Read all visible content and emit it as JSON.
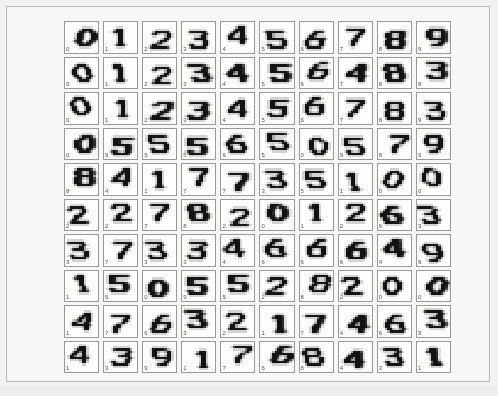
{
  "figure": {
    "type": "digit-thumbnail-grid",
    "rows": 10,
    "columns": 10,
    "total_cells": 100,
    "background_color": "#f2f2f0",
    "panel_color": "#f7f7f5",
    "panel_border_color": "#b8b8b4",
    "cell_background_color": "#fdfdfb",
    "cell_border_color": "#9a9a96",
    "ink_color": "#1a1a1a",
    "label_color": "#5a5a58",
    "label_position": "bottom-left"
  },
  "chart_data": {
    "type": "heatmap",
    "title": "",
    "xlabel": "",
    "ylabel": "",
    "grid": false,
    "legend": "none",
    "rows": 10,
    "columns": 10,
    "labels_by_row": [
      [
        "0",
        "1",
        "2",
        "3",
        "4",
        "5",
        "6",
        "7",
        "8",
        "9"
      ],
      [
        "0",
        "1",
        "2",
        "3",
        "4",
        "5",
        "6",
        "7",
        "8",
        "9"
      ],
      [
        "0",
        "1",
        "2",
        "3",
        "4",
        "5",
        "6",
        "7",
        "8",
        "9"
      ],
      [
        "0",
        "9",
        "5",
        "5",
        "6",
        "5",
        "0",
        "9",
        "8",
        "9"
      ],
      [
        "8",
        "4",
        "1",
        "7",
        "7",
        "3",
        "5",
        "1",
        "0",
        "0"
      ],
      [
        "2",
        "2",
        "7",
        "8",
        "2",
        "0",
        "1",
        "2",
        "6",
        "3"
      ],
      [
        "3",
        "7",
        "3",
        "3",
        "4",
        "6",
        "6",
        "6",
        "4",
        "9"
      ],
      [
        "1",
        "5",
        "0",
        "9",
        "5",
        "2",
        "8",
        "2",
        "0",
        "0"
      ],
      [
        "1",
        "7",
        "6",
        "3",
        "2",
        "1",
        "7",
        "4",
        "6",
        "3"
      ],
      [
        "1",
        "3",
        "9",
        "1",
        "7",
        "6",
        "8",
        "4",
        "3",
        "1"
      ]
    ],
    "glyphs_by_row": [
      [
        "0",
        "1",
        "2",
        "3",
        "4",
        "5",
        "6",
        "7",
        "8",
        "9"
      ],
      [
        "0",
        "1",
        "2",
        "3",
        "4",
        "5",
        "6",
        "4",
        "8",
        "3"
      ],
      [
        "0",
        "1",
        "2",
        "3",
        "4",
        "5",
        "6",
        "7",
        "8",
        "3"
      ],
      [
        "0",
        "5",
        "5",
        "5",
        "6",
        "5",
        "0",
        "5",
        "7",
        "9"
      ],
      [
        "8",
        "4",
        "1",
        "7",
        "7",
        "3",
        "5",
        "1",
        "0",
        "0"
      ],
      [
        "2",
        "2",
        "7",
        "8",
        "2",
        "0",
        "1",
        "2",
        "6",
        "3"
      ],
      [
        "3",
        "7",
        "3",
        "3",
        "4",
        "6",
        "6",
        "6",
        "4",
        "9"
      ],
      [
        "1",
        "5",
        "0",
        "5",
        "5",
        "2",
        "8",
        "2",
        "0",
        "0"
      ],
      [
        "4",
        "7",
        "6",
        "3",
        "2",
        "1",
        "7",
        "4",
        "6",
        "3"
      ],
      [
        "4",
        "3",
        "9",
        "1",
        "7",
        "6",
        "8",
        "4",
        "3",
        "1"
      ]
    ]
  }
}
